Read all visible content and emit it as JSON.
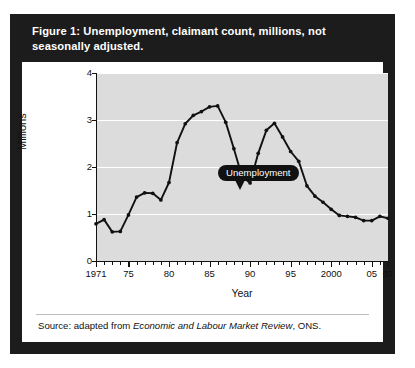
{
  "figure": {
    "title": "Figure 1: Unemployment, claimant count, millions, not seasonally adjusted.",
    "source_prefix": "Source: adapted from ",
    "source_italic": "Economic and Labour Market Review",
    "source_suffix": ", ONS."
  },
  "colors": {
    "frame": "#1c1c1c",
    "panel": "#ffffff",
    "plot_background": "#dcdcdc",
    "gridline": "#ffffff",
    "series": "#111111",
    "callout": "#111111"
  },
  "chart_data": {
    "type": "line",
    "title": "Unemployment, claimant count, millions, not seasonally adjusted",
    "xlabel": "Year",
    "ylabel": "Millions",
    "xlim": [
      1971,
      2007
    ],
    "ylim": [
      0,
      4
    ],
    "yticks": [
      0,
      1,
      2,
      3,
      4
    ],
    "ytick_labels": [
      "0",
      "1",
      "2",
      "3",
      "4"
    ],
    "xticks": [
      1971,
      1975,
      1980,
      1985,
      1990,
      1995,
      2000,
      2005,
      2007
    ],
    "xtick_labels": [
      "1971",
      "75",
      "80",
      "85",
      "90",
      "95",
      "2000",
      "05",
      "07"
    ],
    "minor_xticks_every": 1,
    "grid": "horizontal-white",
    "legend": "none",
    "annotations": [
      {
        "text": "Unemployment",
        "x": 1986,
        "y": 3.3,
        "style": "black-pill-callout"
      }
    ],
    "series": [
      {
        "name": "Unemployment",
        "marker": "filled-circle",
        "x": [
          1971,
          1972,
          1973,
          1974,
          1975,
          1976,
          1977,
          1978,
          1979,
          1980,
          1981,
          1982,
          1983,
          1984,
          1985,
          1986,
          1987,
          1988,
          1989,
          1990,
          1991,
          1992,
          1993,
          1994,
          1995,
          1996,
          1997,
          1998,
          1999,
          2000,
          2001,
          2002,
          2003,
          2004,
          2005,
          2006,
          2007
        ],
        "values": [
          0.79,
          0.88,
          0.62,
          0.63,
          0.98,
          1.36,
          1.45,
          1.44,
          1.3,
          1.67,
          2.52,
          2.92,
          3.1,
          3.18,
          3.28,
          3.3,
          2.95,
          2.39,
          1.8,
          1.66,
          2.29,
          2.78,
          2.93,
          2.64,
          2.33,
          2.12,
          1.6,
          1.38,
          1.25,
          1.1,
          0.97,
          0.95,
          0.93,
          0.86,
          0.86,
          0.95,
          0.91
        ]
      }
    ]
  }
}
